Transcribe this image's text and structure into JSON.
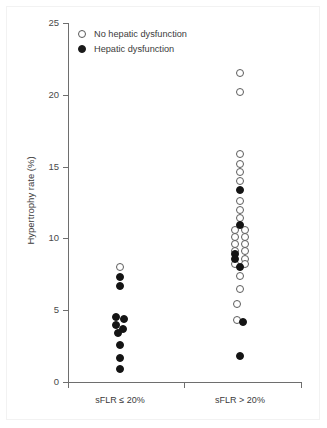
{
  "chart_data": {
    "type": "scatter",
    "title": "",
    "xlabel": "",
    "ylabel": "Hypertrophy rate (%)",
    "ylim": [
      0,
      25
    ],
    "yticks": [
      0,
      5,
      10,
      15,
      20,
      25
    ],
    "ytick_labels": [
      "0",
      "5",
      "10",
      "15",
      "20",
      "25"
    ],
    "categories": [
      "sFLR ≤ 20%",
      "sFLR > 20%"
    ],
    "grid": false,
    "legend_position": "top-left",
    "legend": [
      {
        "label": "No hepatic dysfunction",
        "marker": "open-circle"
      },
      {
        "label": "Hepatic dysfunction",
        "marker": "filled-circle"
      }
    ],
    "series": [
      {
        "name": "No hepatic dysfunction",
        "marker": "open-circle",
        "points": [
          {
            "group": "sFLR ≤ 20%",
            "jitter": 0,
            "y": 8.0
          },
          {
            "group": "sFLR > 20%",
            "jitter": 0,
            "y": 21.5
          },
          {
            "group": "sFLR > 20%",
            "jitter": 0,
            "y": 20.2
          },
          {
            "group": "sFLR > 20%",
            "jitter": 0,
            "y": 15.9
          },
          {
            "group": "sFLR > 20%",
            "jitter": 0,
            "y": 15.2
          },
          {
            "group": "sFLR > 20%",
            "jitter": 0,
            "y": 14.6
          },
          {
            "group": "sFLR > 20%",
            "jitter": 0,
            "y": 14.0
          },
          {
            "group": "sFLR > 20%",
            "jitter": 0,
            "y": 12.6
          },
          {
            "group": "sFLR > 20%",
            "jitter": 0,
            "y": 12.0
          },
          {
            "group": "sFLR > 20%",
            "jitter": 0,
            "y": 11.4
          },
          {
            "group": "sFLR > 20%",
            "jitter": -5,
            "y": 10.6
          },
          {
            "group": "sFLR > 20%",
            "jitter": 5,
            "y": 10.6
          },
          {
            "group": "sFLR > 20%",
            "jitter": -5,
            "y": 10.1
          },
          {
            "group": "sFLR > 20%",
            "jitter": 5,
            "y": 10.1
          },
          {
            "group": "sFLR > 20%",
            "jitter": -5,
            "y": 9.6
          },
          {
            "group": "sFLR > 20%",
            "jitter": 5,
            "y": 9.6
          },
          {
            "group": "sFLR > 20%",
            "jitter": -5,
            "y": 9.1
          },
          {
            "group": "sFLR > 20%",
            "jitter": 5,
            "y": 9.1
          },
          {
            "group": "sFLR > 20%",
            "jitter": 5,
            "y": 8.6
          },
          {
            "group": "sFLR > 20%",
            "jitter": -5,
            "y": 8.2
          },
          {
            "group": "sFLR > 20%",
            "jitter": 5,
            "y": 8.2
          },
          {
            "group": "sFLR > 20%",
            "jitter": 0,
            "y": 7.4
          },
          {
            "group": "sFLR > 20%",
            "jitter": 0,
            "y": 6.5
          },
          {
            "group": "sFLR > 20%",
            "jitter": -3,
            "y": 5.4
          },
          {
            "group": "sFLR > 20%",
            "jitter": -3,
            "y": 4.3
          }
        ]
      },
      {
        "name": "Hepatic dysfunction",
        "marker": "filled-circle",
        "points": [
          {
            "group": "sFLR ≤ 20%",
            "jitter": 0,
            "y": 7.3
          },
          {
            "group": "sFLR ≤ 20%",
            "jitter": 0,
            "y": 6.7
          },
          {
            "group": "sFLR ≤ 20%",
            "jitter": -4,
            "y": 4.5
          },
          {
            "group": "sFLR ≤ 20%",
            "jitter": 4,
            "y": 4.4
          },
          {
            "group": "sFLR ≤ 20%",
            "jitter": -4,
            "y": 4.0
          },
          {
            "group": "sFLR ≤ 20%",
            "jitter": 3,
            "y": 3.7
          },
          {
            "group": "sFLR ≤ 20%",
            "jitter": -2,
            "y": 3.4
          },
          {
            "group": "sFLR ≤ 20%",
            "jitter": 0,
            "y": 2.6
          },
          {
            "group": "sFLR ≤ 20%",
            "jitter": 0,
            "y": 1.7
          },
          {
            "group": "sFLR ≤ 20%",
            "jitter": 0,
            "y": 0.9
          },
          {
            "group": "sFLR > 20%",
            "jitter": 0,
            "y": 13.4
          },
          {
            "group": "sFLR > 20%",
            "jitter": 0,
            "y": 10.9
          },
          {
            "group": "sFLR > 20%",
            "jitter": -5,
            "y": 8.9
          },
          {
            "group": "sFLR > 20%",
            "jitter": -5,
            "y": 8.6
          },
          {
            "group": "sFLR > 20%",
            "jitter": 0,
            "y": 8.0
          },
          {
            "group": "sFLR > 20%",
            "jitter": 3,
            "y": 4.2
          },
          {
            "group": "sFLR > 20%",
            "jitter": 0,
            "y": 1.8
          }
        ]
      }
    ]
  },
  "axis": {
    "y_title": "Hypertrophy rate (%)"
  }
}
